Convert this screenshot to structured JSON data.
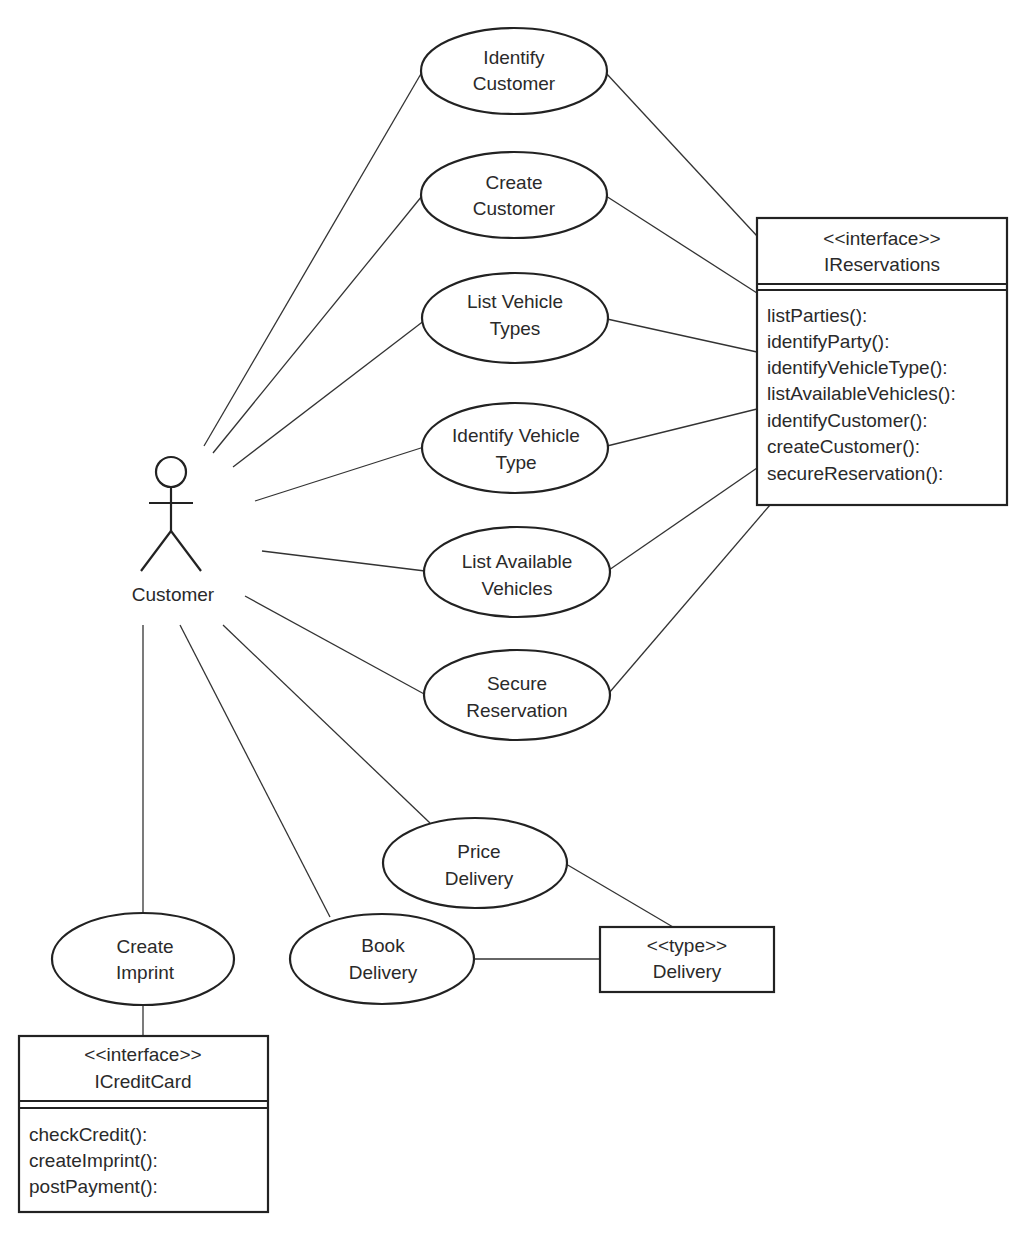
{
  "diagram": {
    "type": "UML use case diagram",
    "actor": {
      "label": "Customer",
      "x": 171,
      "y": 472
    },
    "use_cases": [
      {
        "id": "identify-customer",
        "lines": [
          "Identify",
          "Customer"
        ],
        "cx": 514,
        "cy": 71,
        "rx": 93,
        "ry": 43
      },
      {
        "id": "create-customer",
        "lines": [
          "Create",
          "Customer"
        ],
        "cx": 514,
        "cy": 195,
        "rx": 93,
        "ry": 43
      },
      {
        "id": "list-vehicle-types",
        "lines": [
          "List Vehicle",
          "Types"
        ],
        "cx": 515,
        "cy": 318,
        "rx": 93,
        "ry": 45
      },
      {
        "id": "identify-vehicle-type",
        "lines": [
          "Identify Vehicle",
          "Type"
        ],
        "cx": 515,
        "cy": 448,
        "rx": 93,
        "ry": 45
      },
      {
        "id": "list-available-vehicles",
        "lines": [
          "List Available",
          "Vehicles"
        ],
        "cx": 517,
        "cy": 572,
        "rx": 93,
        "ry": 45
      },
      {
        "id": "secure-reservation",
        "lines": [
          "Secure",
          "Reservation"
        ],
        "cx": 517,
        "cy": 695,
        "rx": 93,
        "ry": 45
      },
      {
        "id": "price-delivery",
        "lines": [
          "Price",
          "Delivery"
        ],
        "cx": 475,
        "cy": 863,
        "rx": 92,
        "ry": 45
      },
      {
        "id": "book-delivery",
        "lines": [
          "Book",
          "Delivery"
        ],
        "cx": 382,
        "cy": 959,
        "rx": 92,
        "ry": 45
      },
      {
        "id": "create-imprint",
        "lines": [
          "Create",
          "Imprint"
        ],
        "cx": 143,
        "cy": 959,
        "rx": 91,
        "ry": 46
      }
    ],
    "interfaces": [
      {
        "id": "ireservations",
        "stereotype": "<<interface>>",
        "name": "IReservations",
        "operations": [
          "listParties():",
          "identifyParty():",
          "identifyVehicleType():",
          "listAvailableVehicles():",
          "identifyCustomer():",
          "createCustomer():",
          "secureReservation():"
        ]
      },
      {
        "id": "icreditcard",
        "stereotype": "<<interface>>",
        "name": "ICreditCard",
        "operations": [
          "checkCredit():",
          "createImprint():",
          "postPayment():"
        ]
      }
    ],
    "types": [
      {
        "id": "delivery",
        "stereotype": "<<type>>",
        "name": "Delivery"
      }
    ],
    "associations": [
      {
        "from": "Customer",
        "to": "Identify Customer"
      },
      {
        "from": "Customer",
        "to": "Create Customer"
      },
      {
        "from": "Customer",
        "to": "List Vehicle Types"
      },
      {
        "from": "Customer",
        "to": "Identify Vehicle Type"
      },
      {
        "from": "Customer",
        "to": "List Available Vehicles"
      },
      {
        "from": "Customer",
        "to": "Secure Reservation"
      },
      {
        "from": "Customer",
        "to": "Price Delivery"
      },
      {
        "from": "Customer",
        "to": "Book Delivery"
      },
      {
        "from": "Customer",
        "to": "Create Imprint"
      },
      {
        "from": "Identify Customer",
        "to": "IReservations"
      },
      {
        "from": "Create Customer",
        "to": "IReservations"
      },
      {
        "from": "List Vehicle Types",
        "to": "IReservations"
      },
      {
        "from": "Identify Vehicle Type",
        "to": "IReservations"
      },
      {
        "from": "List Available Vehicles",
        "to": "IReservations"
      },
      {
        "from": "Secure Reservation",
        "to": "IReservations"
      },
      {
        "from": "Price Delivery",
        "to": "Delivery"
      },
      {
        "from": "Book Delivery",
        "to": "Delivery"
      },
      {
        "from": "Create Imprint",
        "to": "ICreditCard"
      }
    ]
  }
}
